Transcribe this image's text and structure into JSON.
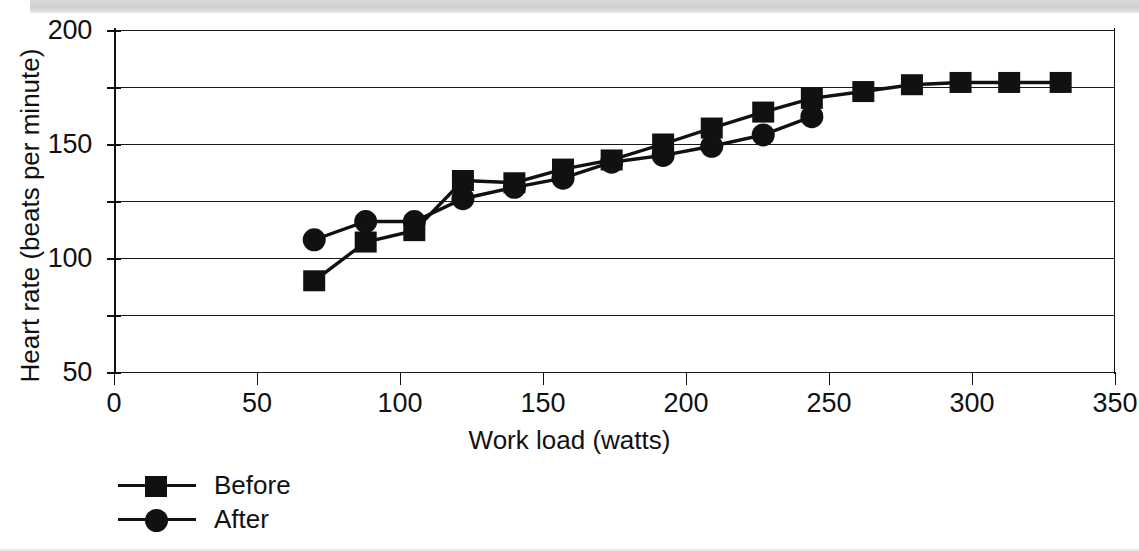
{
  "chart_data": {
    "type": "line",
    "title": "",
    "xlabel": "Work load (watts)",
    "ylabel": "Heart rate (beats per minute)",
    "xlim": [
      0,
      350
    ],
    "ylim": [
      50,
      200
    ],
    "xticks": [
      0,
      50,
      100,
      150,
      200,
      250,
      300,
      350
    ],
    "yticks": [
      50,
      100,
      150,
      200
    ],
    "y_gridlines": [
      50,
      75,
      100,
      125,
      150,
      175,
      200
    ],
    "grid": "horizontal",
    "legend_position": "below-left",
    "series": [
      {
        "name": "Before",
        "marker": "square",
        "color": "#111111",
        "points": [
          {
            "x": 70,
            "y": 90
          },
          {
            "x": 88,
            "y": 107
          },
          {
            "x": 105,
            "y": 112
          },
          {
            "x": 122,
            "y": 134
          },
          {
            "x": 140,
            "y": 133
          },
          {
            "x": 157,
            "y": 139
          },
          {
            "x": 174,
            "y": 143
          },
          {
            "x": 192,
            "y": 150
          },
          {
            "x": 209,
            "y": 157
          },
          {
            "x": 227,
            "y": 164
          },
          {
            "x": 244,
            "y": 170
          },
          {
            "x": 262,
            "y": 173
          },
          {
            "x": 279,
            "y": 176
          },
          {
            "x": 296,
            "y": 177
          },
          {
            "x": 313,
            "y": 177
          },
          {
            "x": 331,
            "y": 177
          }
        ]
      },
      {
        "name": "After",
        "marker": "circle",
        "color": "#111111",
        "points": [
          {
            "x": 70,
            "y": 108
          },
          {
            "x": 88,
            "y": 116
          },
          {
            "x": 105,
            "y": 116
          },
          {
            "x": 122,
            "y": 126
          },
          {
            "x": 140,
            "y": 131
          },
          {
            "x": 157,
            "y": 135
          },
          {
            "x": 174,
            "y": 142
          },
          {
            "x": 192,
            "y": 145
          },
          {
            "x": 209,
            "y": 149
          },
          {
            "x": 227,
            "y": 154
          },
          {
            "x": 244,
            "y": 162
          }
        ]
      }
    ]
  },
  "legend": {
    "items": [
      {
        "label": "Before",
        "marker": "square"
      },
      {
        "label": "After",
        "marker": "circle"
      }
    ]
  }
}
